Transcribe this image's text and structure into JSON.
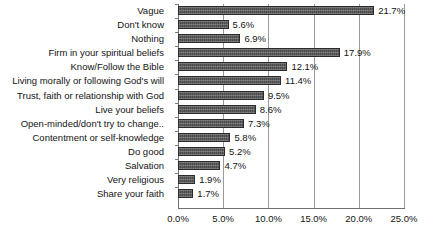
{
  "chart_data": {
    "type": "bar",
    "orientation": "horizontal",
    "title": "",
    "subtitle": "",
    "xlabel": "",
    "ylabel": "",
    "xlim": [
      0,
      25
    ],
    "xticks": [
      0,
      5,
      10,
      15,
      20,
      25
    ],
    "xtick_labels": [
      "0.0%",
      "5.0%",
      "10.0%",
      "15.0%",
      "20.0%",
      "25.0%"
    ],
    "grid": true,
    "grid_axis": "x",
    "legend": false,
    "bar_color": "#4a4a4a",
    "bar_border_color": "#2b2b2b",
    "gridline_color": "#9a9a9a",
    "axis_color": "#6f6f6f",
    "background": "#ffffff",
    "categories": [
      "Vague",
      "Don't know",
      "Nothing",
      "Firm in your spiritual beliefs",
      "Know/Follow the Bible",
      "Living morally or following God's will",
      "Trust, faith or relationship with God",
      "Live your beliefs",
      "Open-minded/don't try to change..",
      "Contentment or self-knowledge",
      "Do good",
      "Salvation",
      "Very religious",
      "Share your faith"
    ],
    "values": [
      21.7,
      5.6,
      6.9,
      17.9,
      12.1,
      11.4,
      9.5,
      8.6,
      7.3,
      5.8,
      5.2,
      4.7,
      1.9,
      1.7
    ],
    "value_labels": [
      "21.7%",
      "5.6%",
      "6.9%",
      "17.9%",
      "12.1%",
      "11.4%",
      "9.5%",
      "8.6%",
      "7.3%",
      "5.8%",
      "5.2%",
      "4.7%",
      "1.9%",
      "1.7%"
    ]
  }
}
